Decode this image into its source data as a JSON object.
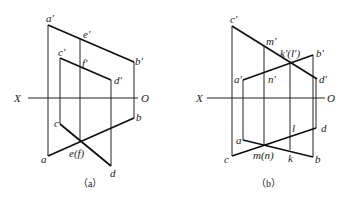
{
  "figure_a": {
    "caption": "（a）",
    "axis": {
      "left": "X",
      "right": "O"
    },
    "labels": {
      "a_prime": "a′",
      "e_prime": "e′",
      "b_prime": "b′",
      "c_prime": "c′",
      "f_prime": "f′",
      "d_prime": "d′",
      "c": "c",
      "b": "b",
      "a": "a",
      "ef": "e(f)",
      "d": "d"
    }
  },
  "figure_b": {
    "caption": "（b）",
    "axis": {
      "left": "X",
      "right": "O"
    },
    "labels": {
      "c_prime": "c′",
      "m_prime": "m′",
      "kl_prime": "k′(l′)",
      "b_prime": "b′",
      "a_prime": "a′",
      "n_prime": "n′",
      "d_prime": "d′",
      "l": "l",
      "d": "d",
      "a": "a",
      "c": "c",
      "mn": "m(n)",
      "k": "k",
      "b": "b"
    }
  }
}
